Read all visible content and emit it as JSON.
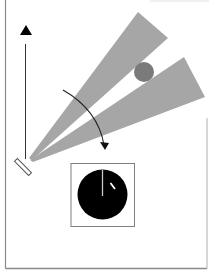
{
  "figure": {
    "colors": {
      "background": "#ffffff",
      "frame": "#8a8a8a",
      "beam": "#a6a6a6",
      "object": "#7a7a7a",
      "axis_arrow": "#000000",
      "rotation_arrow": "#222222",
      "dial_face": "#000000",
      "dial_needle": "#c8c8c8",
      "dial_marker": "#ffffff",
      "dial_box": "#7f7f7f",
      "mirror_outline": "#555555"
    },
    "elements": {
      "vertical_axis_arrow": "arrow-up",
      "mirror": "tilted-mirror",
      "beam_1": "light-beam-upper",
      "beam_2": "light-beam-lower",
      "target": "gray-circle-object",
      "rotation": "curved-clockwise-arrow",
      "dial": "black-dial-with-needle"
    }
  }
}
